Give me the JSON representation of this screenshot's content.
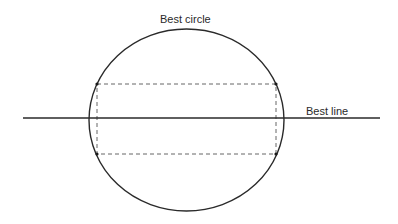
{
  "diagram": {
    "title_label": "Best circle",
    "line_label": "Best line",
    "colors": {
      "stroke": "#2a2a2a",
      "dashed": "#555555",
      "background": "#ffffff"
    },
    "circle": {
      "cx": 186.5,
      "cy": 120,
      "rx": 97.5,
      "ry": 91
    },
    "best_line": {
      "x1": 23,
      "y1": 118,
      "x2": 380,
      "y2": 118
    },
    "dashed_rectangle": {
      "x": 97,
      "y": 84,
      "width": 179,
      "height": 70
    },
    "points": [
      {
        "x": 97,
        "y": 84
      },
      {
        "x": 276,
        "y": 84
      },
      {
        "x": 97,
        "y": 154
      },
      {
        "x": 276,
        "y": 154
      }
    ]
  }
}
